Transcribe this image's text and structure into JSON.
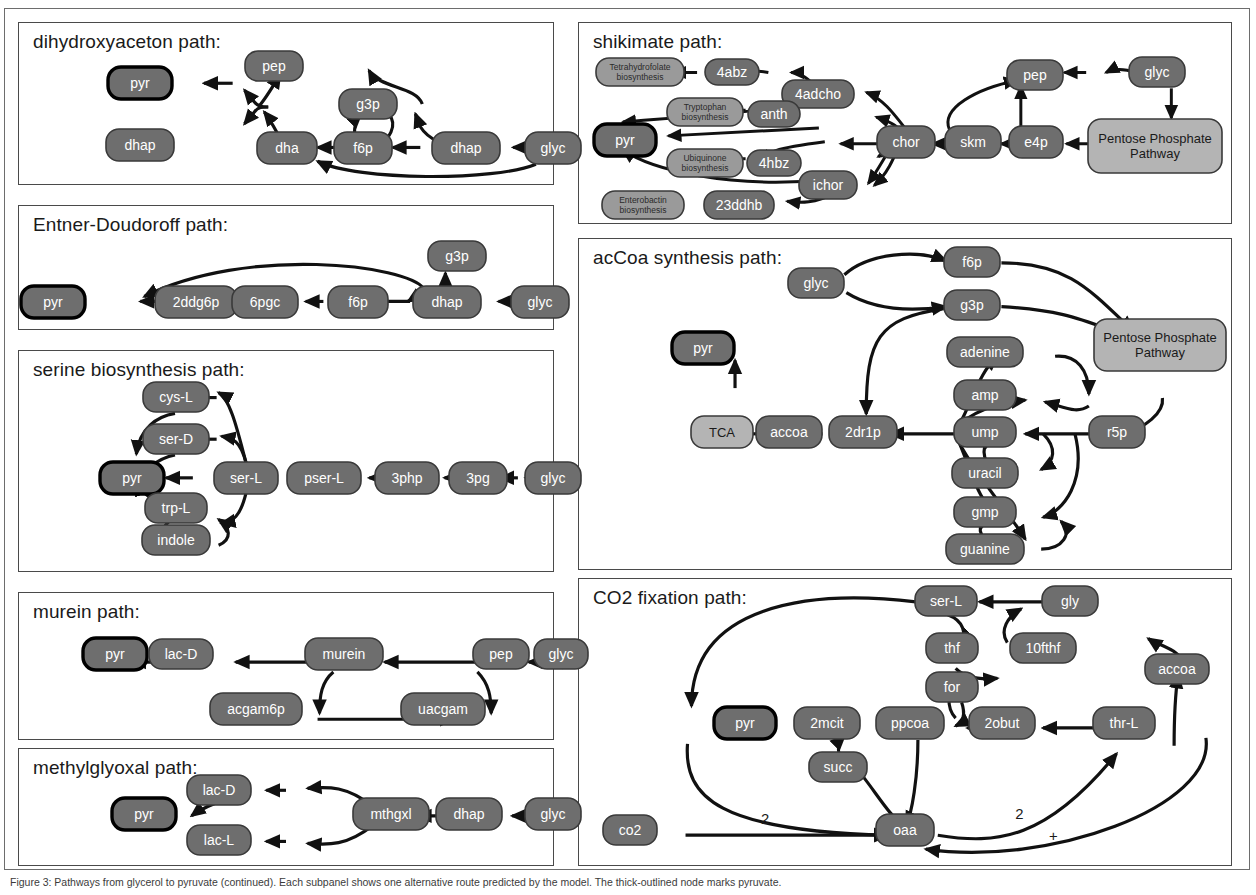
{
  "figure": {
    "caption": "Figure 3: Pathways from glycerol to pyruvate (continued). Each subpanel shows one alternative route predicted by the model. The thick-outlined node marks pyruvate.",
    "colors": {
      "node_dark": "#6e6e6e",
      "node_light": "#b4b4b4",
      "node_mid": "#9a9a9a",
      "node_text_light": "#ffffff",
      "node_text_dark": "#1a1a1a",
      "edge": "#111111",
      "panel_border": "#4a4a4a",
      "frame_border": "#6d6d6d"
    }
  },
  "panels": [
    {
      "id": "dihydroxyaceton",
      "title": "dihydroxyaceton path:",
      "nodes": [
        {
          "id": "pyr",
          "label": "pyr",
          "x": 140,
          "y": 83,
          "w": 64,
          "h": 32,
          "style": "target"
        },
        {
          "id": "dhap_l",
          "label": "dhap",
          "x": 140,
          "y": 145,
          "w": 68,
          "h": 32,
          "style": "dark"
        },
        {
          "id": "pep",
          "label": "pep",
          "x": 274,
          "y": 66,
          "w": 58,
          "h": 30,
          "style": "dark"
        },
        {
          "id": "dha",
          "label": "dha",
          "x": 287,
          "y": 148,
          "w": 60,
          "h": 32,
          "style": "dark"
        },
        {
          "id": "g3p",
          "label": "g3p",
          "x": 368,
          "y": 104,
          "w": 58,
          "h": 30,
          "style": "dark"
        },
        {
          "id": "f6p",
          "label": "f6p",
          "x": 363,
          "y": 148,
          "w": 58,
          "h": 32,
          "style": "dark"
        },
        {
          "id": "dhap_r",
          "label": "dhap",
          "x": 466,
          "y": 148,
          "w": 68,
          "h": 32,
          "style": "dark"
        },
        {
          "id": "glyc",
          "label": "glyc",
          "x": 553,
          "y": 148,
          "w": 56,
          "h": 32,
          "style": "dark"
        }
      ]
    },
    {
      "id": "entner",
      "title": "Entner-Doudoroff path:",
      "nodes": [
        {
          "id": "pyr",
          "label": "pyr",
          "x": 53,
          "y": 302,
          "w": 64,
          "h": 32,
          "style": "target"
        },
        {
          "id": "2ddg6p",
          "label": "2ddg6p",
          "x": 196,
          "y": 302,
          "w": 82,
          "h": 32,
          "style": "dark"
        },
        {
          "id": "6pgc",
          "label": "6pgc",
          "x": 265,
          "y": 302,
          "w": 66,
          "h": 32,
          "style": "dark"
        },
        {
          "id": "f6p",
          "label": "f6p",
          "x": 358,
          "y": 302,
          "w": 60,
          "h": 32,
          "style": "dark"
        },
        {
          "id": "dhap",
          "label": "dhap",
          "x": 447,
          "y": 302,
          "w": 68,
          "h": 32,
          "style": "dark"
        },
        {
          "id": "glyc",
          "label": "glyc",
          "x": 540,
          "y": 302,
          "w": 58,
          "h": 32,
          "style": "dark"
        },
        {
          "id": "g3p",
          "label": "g3p",
          "x": 457,
          "y": 256,
          "w": 58,
          "h": 30,
          "style": "dark"
        }
      ]
    },
    {
      "id": "serine",
      "title": "serine biosynthesis path:",
      "nodes": [
        {
          "id": "cys-L",
          "label": "cys-L",
          "x": 176,
          "y": 397,
          "w": 66,
          "h": 30,
          "style": "dark"
        },
        {
          "id": "ser-D",
          "label": "ser-D",
          "x": 176,
          "y": 439,
          "w": 66,
          "h": 30,
          "style": "dark"
        },
        {
          "id": "pyr",
          "label": "pyr",
          "x": 132,
          "y": 478,
          "w": 64,
          "h": 32,
          "style": "target"
        },
        {
          "id": "trp-L",
          "label": "trp-L",
          "x": 176,
          "y": 508,
          "w": 62,
          "h": 30,
          "style": "dark"
        },
        {
          "id": "indole",
          "label": "indole",
          "x": 176,
          "y": 540,
          "w": 68,
          "h": 30,
          "style": "dark"
        },
        {
          "id": "ser-L",
          "label": "ser-L",
          "x": 246,
          "y": 478,
          "w": 64,
          "h": 32,
          "style": "dark"
        },
        {
          "id": "pser-L",
          "label": "pser-L",
          "x": 324,
          "y": 478,
          "w": 74,
          "h": 32,
          "style": "dark"
        },
        {
          "id": "3php",
          "label": "3php",
          "x": 407,
          "y": 478,
          "w": 64,
          "h": 32,
          "style": "dark"
        },
        {
          "id": "3pg",
          "label": "3pg",
          "x": 478,
          "y": 478,
          "w": 58,
          "h": 32,
          "style": "dark"
        },
        {
          "id": "glyc",
          "label": "glyc",
          "x": 553,
          "y": 478,
          "w": 56,
          "h": 32,
          "style": "dark"
        }
      ]
    },
    {
      "id": "murein",
      "title": "murein path:",
      "nodes": [
        {
          "id": "pyr",
          "label": "pyr",
          "x": 115,
          "y": 654,
          "w": 64,
          "h": 32,
          "style": "target"
        },
        {
          "id": "lac-D",
          "label": "lac-D",
          "x": 181,
          "y": 654,
          "w": 64,
          "h": 30,
          "style": "dark"
        },
        {
          "id": "murein",
          "label": "murein",
          "x": 344,
          "y": 654,
          "w": 78,
          "h": 32,
          "style": "dark"
        },
        {
          "id": "pep",
          "label": "pep",
          "x": 501,
          "y": 654,
          "w": 56,
          "h": 30,
          "style": "dark"
        },
        {
          "id": "glyc",
          "label": "glyc",
          "x": 561,
          "y": 654,
          "w": 54,
          "h": 30,
          "style": "dark"
        },
        {
          "id": "acgam6p",
          "label": "acgam6p",
          "x": 256,
          "y": 709,
          "w": 92,
          "h": 32,
          "style": "dark"
        },
        {
          "id": "uacgam",
          "label": "uacgam",
          "x": 443,
          "y": 709,
          "w": 84,
          "h": 32,
          "style": "dark"
        }
      ]
    },
    {
      "id": "methylglyoxal",
      "title": "methylglyoxal path:",
      "nodes": [
        {
          "id": "pyr",
          "label": "pyr",
          "x": 144,
          "y": 814,
          "w": 64,
          "h": 32,
          "style": "target"
        },
        {
          "id": "lac-D",
          "label": "lac-D",
          "x": 219,
          "y": 790,
          "w": 64,
          "h": 30,
          "style": "dark"
        },
        {
          "id": "lac-L",
          "label": "lac-L",
          "x": 219,
          "y": 840,
          "w": 64,
          "h": 30,
          "style": "dark"
        },
        {
          "id": "mthgxl",
          "label": "mthgxl",
          "x": 391,
          "y": 814,
          "w": 76,
          "h": 32,
          "style": "dark"
        },
        {
          "id": "dhap",
          "label": "dhap",
          "x": 469,
          "y": 814,
          "w": 66,
          "h": 32,
          "style": "dark"
        },
        {
          "id": "glyc",
          "label": "glyc",
          "x": 553,
          "y": 814,
          "w": 56,
          "h": 32,
          "style": "dark"
        }
      ]
    },
    {
      "id": "shikimate",
      "title": "shikimate path:",
      "nodes": [
        {
          "id": "thf_bio",
          "label": "Tetrahydrofolate biosynthesis",
          "x": 640,
          "y": 72,
          "w": 88,
          "h": 28,
          "style": "mid"
        },
        {
          "id": "4abz",
          "label": "4abz",
          "x": 732,
          "y": 72,
          "w": 54,
          "h": 26,
          "style": "dark"
        },
        {
          "id": "4adcho",
          "label": "4adcho",
          "x": 818,
          "y": 94,
          "w": 72,
          "h": 28,
          "style": "dark"
        },
        {
          "id": "trp_bio",
          "label": "Tryptophan biosynthesis",
          "x": 705,
          "y": 112,
          "w": 76,
          "h": 28,
          "style": "mid"
        },
        {
          "id": "anth",
          "label": "anth",
          "x": 774,
          "y": 114,
          "w": 52,
          "h": 26,
          "style": "dark"
        },
        {
          "id": "pyr",
          "label": "pyr",
          "x": 625,
          "y": 140,
          "w": 62,
          "h": 32,
          "style": "target"
        },
        {
          "id": "ubq_bio",
          "label": "Ubiquinone biosynthesis",
          "x": 705,
          "y": 163,
          "w": 76,
          "h": 28,
          "style": "mid"
        },
        {
          "id": "4hbz",
          "label": "4hbz",
          "x": 774,
          "y": 163,
          "w": 54,
          "h": 26,
          "style": "dark"
        },
        {
          "id": "ichor",
          "label": "ichor",
          "x": 828,
          "y": 185,
          "w": 58,
          "h": 28,
          "style": "dark"
        },
        {
          "id": "entb_bio",
          "label": "Enterobactin biosynthesis",
          "x": 643,
          "y": 205,
          "w": 82,
          "h": 28,
          "style": "mid"
        },
        {
          "id": "23ddhb",
          "label": "23ddhb",
          "x": 739,
          "y": 205,
          "w": 70,
          "h": 28,
          "style": "dark"
        },
        {
          "id": "chor",
          "label": "chor",
          "x": 906,
          "y": 142,
          "w": 58,
          "h": 32,
          "style": "dark"
        },
        {
          "id": "skm",
          "label": "skm",
          "x": 973,
          "y": 142,
          "w": 56,
          "h": 32,
          "style": "dark"
        },
        {
          "id": "e4p",
          "label": "e4p",
          "x": 1036,
          "y": 142,
          "w": 54,
          "h": 32,
          "style": "dark"
        },
        {
          "id": "pep",
          "label": "pep",
          "x": 1035,
          "y": 75,
          "w": 56,
          "h": 30,
          "style": "dark"
        },
        {
          "id": "glyc",
          "label": "glyc",
          "x": 1157,
          "y": 72,
          "w": 56,
          "h": 30,
          "style": "dark"
        },
        {
          "id": "ppp",
          "label": "Pentose Phosphate Pathway",
          "x": 1155,
          "y": 146,
          "w": 134,
          "h": 54,
          "style": "light"
        }
      ]
    },
    {
      "id": "accoa",
      "title": "acCoa synthesis path:",
      "nodes": [
        {
          "id": "glyc",
          "label": "glyc",
          "x": 816,
          "y": 283,
          "w": 56,
          "h": 30,
          "style": "dark"
        },
        {
          "id": "f6p",
          "label": "f6p",
          "x": 972,
          "y": 262,
          "w": 56,
          "h": 30,
          "style": "dark"
        },
        {
          "id": "g3p",
          "label": "g3p",
          "x": 972,
          "y": 305,
          "w": 56,
          "h": 30,
          "style": "dark"
        },
        {
          "id": "ppp",
          "label": "Pentose Phosphate Pathway",
          "x": 1160,
          "y": 345,
          "w": 132,
          "h": 52,
          "style": "light"
        },
        {
          "id": "pyr",
          "label": "pyr",
          "x": 703,
          "y": 348,
          "w": 62,
          "h": 32,
          "style": "target"
        },
        {
          "id": "adenine",
          "label": "adenine",
          "x": 985,
          "y": 352,
          "w": 76,
          "h": 30,
          "style": "dark"
        },
        {
          "id": "amp",
          "label": "amp",
          "x": 985,
          "y": 395,
          "w": 62,
          "h": 30,
          "style": "dark"
        },
        {
          "id": "TCA",
          "label": "TCA",
          "x": 722,
          "y": 432,
          "w": 62,
          "h": 32,
          "style": "light"
        },
        {
          "id": "accoa",
          "label": "accoa",
          "x": 789,
          "y": 432,
          "w": 66,
          "h": 32,
          "style": "dark"
        },
        {
          "id": "2dr1p",
          "label": "2dr1p",
          "x": 863,
          "y": 432,
          "w": 68,
          "h": 32,
          "style": "dark"
        },
        {
          "id": "ump",
          "label": "ump",
          "x": 985,
          "y": 432,
          "w": 62,
          "h": 30,
          "style": "dark"
        },
        {
          "id": "r5p",
          "label": "r5p",
          "x": 1117,
          "y": 432,
          "w": 56,
          "h": 32,
          "style": "dark"
        },
        {
          "id": "uracil",
          "label": "uracil",
          "x": 985,
          "y": 473,
          "w": 66,
          "h": 30,
          "style": "dark"
        },
        {
          "id": "gmp",
          "label": "gmp",
          "x": 985,
          "y": 512,
          "w": 62,
          "h": 30,
          "style": "dark"
        },
        {
          "id": "guanine",
          "label": "guanine",
          "x": 985,
          "y": 549,
          "w": 78,
          "h": 30,
          "style": "dark"
        }
      ]
    },
    {
      "id": "co2fix",
      "title": "CO2 fixation path:",
      "nodes": [
        {
          "id": "ser-L",
          "label": "ser-L",
          "x": 946,
          "y": 601,
          "w": 62,
          "h": 30,
          "style": "dark"
        },
        {
          "id": "gly",
          "label": "gly",
          "x": 1070,
          "y": 601,
          "w": 56,
          "h": 30,
          "style": "dark"
        },
        {
          "id": "thf",
          "label": "thf",
          "x": 952,
          "y": 648,
          "w": 52,
          "h": 30,
          "style": "dark"
        },
        {
          "id": "10fthf",
          "label": "10fthf",
          "x": 1043,
          "y": 648,
          "w": 66,
          "h": 30,
          "style": "dark"
        },
        {
          "id": "accoa",
          "label": "accoa",
          "x": 1177,
          "y": 669,
          "w": 64,
          "h": 30,
          "style": "dark"
        },
        {
          "id": "for",
          "label": "for",
          "x": 952,
          "y": 687,
          "w": 52,
          "h": 30,
          "style": "dark"
        },
        {
          "id": "pyr",
          "label": "pyr",
          "x": 745,
          "y": 723,
          "w": 62,
          "h": 32,
          "style": "target"
        },
        {
          "id": "2mcit",
          "label": "2mcit",
          "x": 827,
          "y": 723,
          "w": 66,
          "h": 32,
          "style": "dark"
        },
        {
          "id": "ppcoa",
          "label": "ppcoa",
          "x": 910,
          "y": 723,
          "w": 68,
          "h": 32,
          "style": "dark"
        },
        {
          "id": "2obut",
          "label": "2obut",
          "x": 1002,
          "y": 723,
          "w": 66,
          "h": 32,
          "style": "dark"
        },
        {
          "id": "thr-L",
          "label": "thr-L",
          "x": 1124,
          "y": 723,
          "w": 62,
          "h": 32,
          "style": "dark"
        },
        {
          "id": "succ",
          "label": "succ",
          "x": 838,
          "y": 767,
          "w": 58,
          "h": 30,
          "style": "dark"
        },
        {
          "id": "co2",
          "label": "co2",
          "x": 630,
          "y": 830,
          "w": 54,
          "h": 30,
          "style": "dark"
        },
        {
          "id": "oaa",
          "label": "oaa",
          "x": 905,
          "y": 830,
          "w": 58,
          "h": 32,
          "style": "dark"
        }
      ],
      "edge_labels": [
        {
          "text": "2",
          "x": 760,
          "y": 824
        },
        {
          "text": "2",
          "x": 1016,
          "y": 819
        },
        {
          "text": "+",
          "x": 1050,
          "y": 840
        }
      ]
    }
  ]
}
